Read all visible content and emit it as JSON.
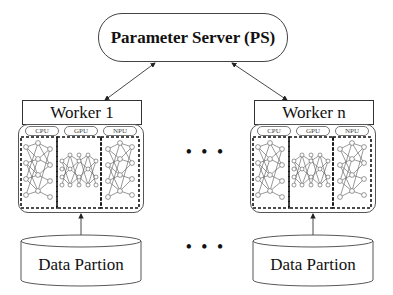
{
  "diagram": {
    "parameter_server": {
      "label": "Parameter Server (PS)"
    },
    "workers": [
      {
        "label": "Worker 1",
        "hardware": [
          "CPU",
          "GPU",
          "NPU"
        ],
        "data": "Data Partion"
      },
      {
        "label": "Worker n",
        "hardware": [
          "CPU",
          "GPU",
          "NPU"
        ],
        "data": "Data Partion"
      }
    ],
    "ellipsis": "• • •",
    "edges": [
      {
        "from": "Parameter Server (PS)",
        "to": "Worker 1",
        "type": "bidirectional"
      },
      {
        "from": "Parameter Server (PS)",
        "to": "Worker n",
        "type": "bidirectional"
      },
      {
        "from": "Data Partion",
        "to": "Worker 1",
        "type": "directed"
      },
      {
        "from": "Data Partion",
        "to": "Worker n",
        "type": "directed"
      }
    ],
    "colors": {
      "stroke": "#333333",
      "background": "#ffffff"
    }
  }
}
